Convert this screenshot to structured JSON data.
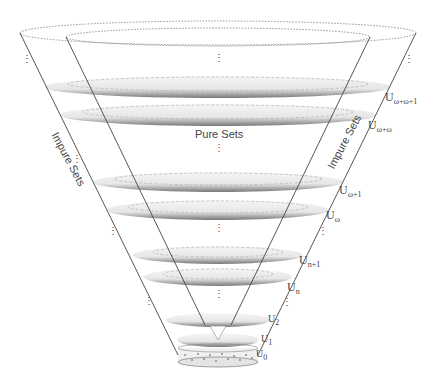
{
  "diagram": {
    "region_labels": {
      "pure": "Pure Sets",
      "impure_left": "Impure Sets",
      "impure_right": "Impure Sets"
    },
    "levels": [
      {
        "base": "U",
        "sub": "ω+ω+1"
      },
      {
        "base": "U",
        "sub": "ω+ω"
      },
      {
        "base": "U",
        "sub": "ω+1"
      },
      {
        "base": "U",
        "sub": "ω"
      },
      {
        "base": "U",
        "sub": "n+1"
      },
      {
        "base": "U",
        "sub": "n"
      },
      {
        "base": "U",
        "sub": "2"
      },
      {
        "base": "U",
        "sub": "1"
      },
      {
        "base": "U",
        "sub": "0"
      }
    ],
    "ellipsis_vertical": "⋮",
    "ellipsis_diag": "⋰",
    "colors": {
      "line": "#444444",
      "disc_shadow": "#888888",
      "label": "#444444"
    }
  }
}
